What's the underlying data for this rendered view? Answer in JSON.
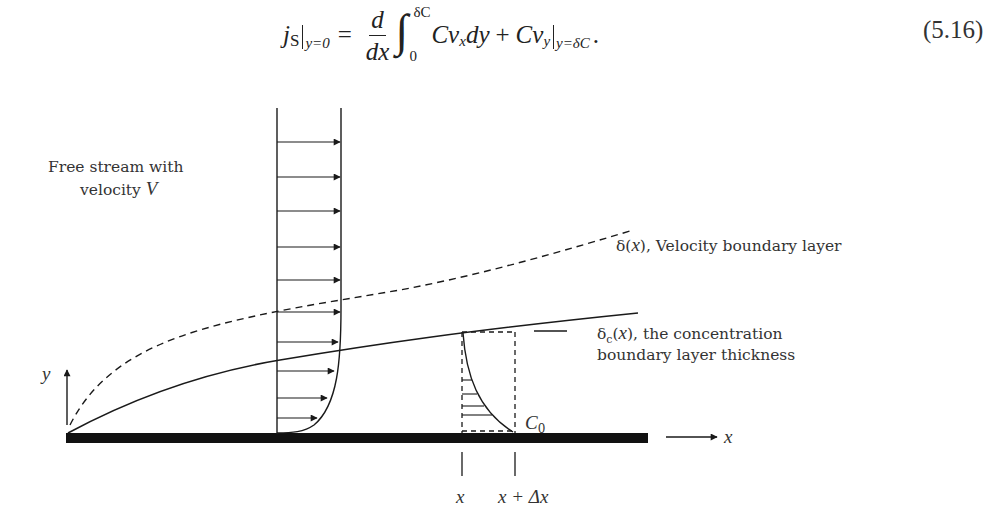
{
  "equation": {
    "lhs_symbol": "j",
    "lhs_subscript": "S",
    "lhs_eval": "y=0",
    "equals": "=",
    "frac_num": "d",
    "frac_den": "dx",
    "integral": "∫",
    "int_upper": "δC",
    "int_lower": "0",
    "integrand": "Cv",
    "integrand_sub": "x",
    "differential": "dy",
    "plus": "+",
    "term2": "Cv",
    "term2_sub": "y",
    "term2_eval": "y=δC",
    "period": ".",
    "number": "(5.16)"
  },
  "diagram": {
    "labels": {
      "free_stream_line1": "Free stream with",
      "free_stream_line2_prefix": "velocity ",
      "free_stream_line2_var": "V",
      "velocity_bl_prefix": "δ(",
      "velocity_bl_var": "x",
      "velocity_bl_suffix": "), Velocity boundary layer",
      "conc_bl_prefix": "δ",
      "conc_bl_sub": "c",
      "conc_bl_paren_open": "(",
      "conc_bl_var": "x",
      "conc_bl_rest": "),  the concentration",
      "conc_bl_line2": "boundary layer thickness",
      "y_axis": "y",
      "x_axis": "x",
      "c0_main": "C",
      "c0_sub": "0",
      "tick_x": "x",
      "tick_x_dx": "x + Δx"
    },
    "velocity_profile_arrow_count": 10,
    "concentration_profile_hatch_count": 4,
    "colors": {
      "ink": "#1a1a1a",
      "plate": "#111111",
      "text": "#333333"
    }
  }
}
